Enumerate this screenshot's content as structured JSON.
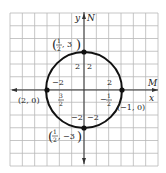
{
  "diagram": {
    "type": "coordinate-grid-circle",
    "colors": {
      "grid": "#b8b8b8",
      "axis": "#333333",
      "curve": "#111111",
      "text": "#222222",
      "background": "#ffffff"
    },
    "grid": {
      "x0": 10,
      "y0": 13,
      "x1": 158,
      "y1": 166,
      "cols": 12,
      "rows": 12
    },
    "axes": {
      "origin_px": [
        84,
        90
      ],
      "y_axis_label": "y",
      "y_axis_label2": "N",
      "x_axis_label": "x",
      "x_axis_label2": "M"
    },
    "circle": {
      "cx": 84,
      "cy": 90,
      "r": 38
    },
    "points": [
      {
        "name": "top",
        "px": [
          84,
          52
        ],
        "label_num": "1",
        "label_den": "2",
        "label_rest": ", 3"
      },
      {
        "name": "bottom",
        "px": [
          84,
          128
        ],
        "label_num": "1",
        "label_den": "2",
        "label_rest": ", −3"
      },
      {
        "name": "left",
        "px": [
          47,
          90
        ],
        "label": "(2, 0)"
      },
      {
        "name": "right",
        "px": [
          122,
          90
        ],
        "label": "(−1, 0)"
      }
    ],
    "annotations": {
      "top_left_2": "2",
      "top_right_2": "2",
      "left_minus2": "−2",
      "left_frac_num": "3",
      "left_frac_den": "2",
      "right_2": "2",
      "right_frac_sign": "−",
      "right_frac_num": "1",
      "right_frac_den": "2",
      "bottom_left_minus2": "−2",
      "bottom_right_minus2": "−2"
    }
  }
}
